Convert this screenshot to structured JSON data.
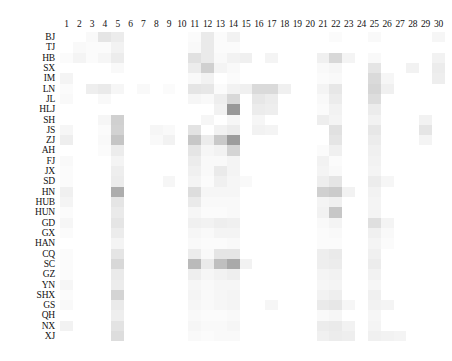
{
  "figure": {
    "type": "heatmap",
    "colormap": "greys",
    "background": "#ffffff",
    "low_color": "#ffffff",
    "high_color": "#4d4d4d"
  },
  "chart_data": {
    "type": "heatmap",
    "title": "",
    "xlabel": "",
    "ylabel": "",
    "grid": false,
    "legend": "none",
    "colormap": "Greys",
    "vmin": 0,
    "vmax": 1,
    "x": [
      "1",
      "2",
      "3",
      "4",
      "5",
      "6",
      "7",
      "8",
      "9",
      "10",
      "11",
      "12",
      "13",
      "14",
      "15",
      "16",
      "17",
      "18",
      "19",
      "20",
      "21",
      "22",
      "23",
      "24",
      "25",
      "26",
      "27",
      "28",
      "29",
      "30"
    ],
    "y": [
      "BJ",
      "TJ",
      "HB",
      "SX",
      "IM",
      "LN",
      "JL",
      "HLJ",
      "SH",
      "JS",
      "ZJ",
      "AH",
      "FJ",
      "JX",
      "SD",
      "HN",
      "HUB",
      "HUN",
      "GD",
      "GX",
      "HAN",
      "CQ",
      "SC",
      "GZ",
      "YN",
      "SHX",
      "GS",
      "QH",
      "NX",
      "XJ"
    ],
    "xlabel_position": "top",
    "values": [
      [
        0.0,
        0.0,
        0.03,
        0.12,
        0.09,
        0.0,
        0.0,
        0.0,
        0.0,
        0.0,
        0.02,
        0.1,
        0.02,
        0.06,
        0.0,
        0.0,
        0.0,
        0.0,
        0.0,
        0.0,
        0.0,
        0.02,
        0.0,
        0.0,
        0.03,
        0.0,
        0.0,
        0.0,
        0.0,
        0.04
      ],
      [
        0.0,
        0.03,
        0.02,
        0.02,
        0.06,
        0.0,
        0.0,
        0.0,
        0.0,
        0.0,
        0.03,
        0.1,
        0.02,
        0.02,
        0.0,
        0.0,
        0.0,
        0.0,
        0.0,
        0.0,
        0.0,
        0.0,
        0.0,
        0.0,
        0.0,
        0.0,
        0.0,
        0.0,
        0.0,
        0.0
      ],
      [
        0.02,
        0.05,
        0.02,
        0.04,
        0.09,
        0.0,
        0.0,
        0.0,
        0.0,
        0.0,
        0.14,
        0.1,
        0.03,
        0.06,
        0.07,
        0.0,
        0.05,
        0.0,
        0.0,
        0.0,
        0.07,
        0.18,
        0.05,
        0.0,
        0.03,
        0.0,
        0.0,
        0.0,
        0.0,
        0.06
      ],
      [
        0.0,
        0.0,
        0.0,
        0.0,
        0.03,
        0.0,
        0.0,
        0.0,
        0.0,
        0.0,
        0.09,
        0.22,
        0.05,
        0.03,
        0.0,
        0.0,
        0.0,
        0.0,
        0.0,
        0.0,
        0.03,
        0.04,
        0.0,
        0.0,
        0.12,
        0.0,
        0.0,
        0.06,
        0.0,
        0.09
      ],
      [
        0.05,
        0.0,
        0.0,
        0.0,
        0.0,
        0.0,
        0.0,
        0.0,
        0.0,
        0.0,
        0.03,
        0.06,
        0.0,
        0.02,
        0.0,
        0.0,
        0.0,
        0.0,
        0.0,
        0.0,
        0.02,
        0.03,
        0.0,
        0.0,
        0.17,
        0.04,
        0.0,
        0.0,
        0.0,
        0.08
      ],
      [
        0.02,
        0.0,
        0.08,
        0.1,
        0.04,
        0.0,
        0.03,
        0.0,
        0.02,
        0.0,
        0.12,
        0.11,
        0.02,
        0.06,
        0.07,
        0.17,
        0.17,
        0.07,
        0.0,
        0.0,
        0.05,
        0.11,
        0.0,
        0.0,
        0.19,
        0.07,
        0.0,
        0.0,
        0.0,
        0.0
      ],
      [
        0.03,
        0.0,
        0.0,
        0.03,
        0.0,
        0.0,
        0.0,
        0.0,
        0.0,
        0.0,
        0.04,
        0.03,
        0.08,
        0.18,
        0.0,
        0.11,
        0.09,
        0.0,
        0.0,
        0.0,
        0.03,
        0.09,
        0.0,
        0.0,
        0.16,
        0.0,
        0.0,
        0.0,
        0.0,
        0.0
      ],
      [
        0.0,
        0.0,
        0.0,
        0.0,
        0.0,
        0.0,
        0.0,
        0.0,
        0.0,
        0.0,
        0.0,
        0.0,
        0.06,
        0.48,
        0.0,
        0.09,
        0.08,
        0.0,
        0.0,
        0.0,
        0.02,
        0.06,
        0.0,
        0.0,
        0.09,
        0.0,
        0.0,
        0.0,
        0.0,
        0.0
      ],
      [
        0.0,
        0.0,
        0.0,
        0.04,
        0.22,
        0.0,
        0.0,
        0.0,
        0.0,
        0.0,
        0.0,
        0.04,
        0.0,
        0.04,
        0.0,
        0.04,
        0.0,
        0.0,
        0.0,
        0.0,
        0.08,
        0.05,
        0.0,
        0.0,
        0.06,
        0.0,
        0.0,
        0.0,
        0.06,
        0.0
      ],
      [
        0.04,
        0.0,
        0.0,
        0.02,
        0.21,
        0.0,
        0.0,
        0.04,
        0.03,
        0.0,
        0.13,
        0.0,
        0.06,
        0.09,
        0.0,
        0.06,
        0.05,
        0.0,
        0.0,
        0.0,
        0.0,
        0.14,
        0.0,
        0.0,
        0.11,
        0.0,
        0.0,
        0.0,
        0.12,
        0.0
      ],
      [
        0.08,
        0.0,
        0.0,
        0.03,
        0.27,
        0.0,
        0.0,
        0.03,
        0.06,
        0.0,
        0.26,
        0.09,
        0.25,
        0.46,
        0.0,
        0.0,
        0.0,
        0.0,
        0.0,
        0.0,
        0.0,
        0.12,
        0.0,
        0.0,
        0.09,
        0.0,
        0.0,
        0.0,
        0.05,
        0.0
      ],
      [
        0.0,
        0.0,
        0.0,
        0.02,
        0.09,
        0.0,
        0.0,
        0.0,
        0.0,
        0.0,
        0.12,
        0.04,
        0.06,
        0.2,
        0.0,
        0.0,
        0.0,
        0.0,
        0.0,
        0.0,
        0.02,
        0.07,
        0.0,
        0.0,
        0.07,
        0.0,
        0.0,
        0.0,
        0.0,
        0.0
      ],
      [
        0.03,
        0.0,
        0.0,
        0.0,
        0.05,
        0.0,
        0.0,
        0.0,
        0.0,
        0.0,
        0.09,
        0.03,
        0.03,
        0.05,
        0.0,
        0.0,
        0.0,
        0.0,
        0.0,
        0.0,
        0.06,
        0.02,
        0.0,
        0.0,
        0.06,
        0.0,
        0.0,
        0.0,
        0.0,
        0.0
      ],
      [
        0.02,
        0.0,
        0.0,
        0.0,
        0.08,
        0.0,
        0.0,
        0.0,
        0.0,
        0.0,
        0.07,
        0.03,
        0.1,
        0.05,
        0.0,
        0.0,
        0.0,
        0.0,
        0.0,
        0.0,
        0.05,
        0.03,
        0.0,
        0.0,
        0.05,
        0.0,
        0.0,
        0.0,
        0.0,
        0.0
      ],
      [
        0.02,
        0.0,
        0.0,
        0.0,
        0.09,
        0.0,
        0.0,
        0.0,
        0.04,
        0.0,
        0.05,
        0.02,
        0.07,
        0.04,
        0.03,
        0.0,
        0.0,
        0.0,
        0.0,
        0.0,
        0.08,
        0.12,
        0.0,
        0.0,
        0.09,
        0.04,
        0.0,
        0.0,
        0.0,
        0.0
      ],
      [
        0.07,
        0.0,
        0.0,
        0.0,
        0.38,
        0.0,
        0.0,
        0.0,
        0.0,
        0.0,
        0.16,
        0.04,
        0.04,
        0.04,
        0.0,
        0.0,
        0.0,
        0.0,
        0.0,
        0.0,
        0.22,
        0.24,
        0.06,
        0.0,
        0.06,
        0.0,
        0.0,
        0.0,
        0.0,
        0.0
      ],
      [
        0.05,
        0.0,
        0.0,
        0.0,
        0.12,
        0.0,
        0.0,
        0.0,
        0.0,
        0.0,
        0.1,
        0.03,
        0.03,
        0.03,
        0.0,
        0.0,
        0.0,
        0.0,
        0.0,
        0.0,
        0.05,
        0.07,
        0.0,
        0.0,
        0.05,
        0.0,
        0.0,
        0.0,
        0.0,
        0.0
      ],
      [
        0.02,
        0.0,
        0.0,
        0.0,
        0.1,
        0.0,
        0.0,
        0.0,
        0.0,
        0.0,
        0.04,
        0.02,
        0.02,
        0.03,
        0.0,
        0.0,
        0.0,
        0.0,
        0.0,
        0.0,
        0.06,
        0.26,
        0.0,
        0.0,
        0.05,
        0.0,
        0.0,
        0.0,
        0.0,
        0.0
      ],
      [
        0.04,
        0.0,
        0.0,
        0.0,
        0.12,
        0.0,
        0.0,
        0.0,
        0.0,
        0.0,
        0.07,
        0.06,
        0.08,
        0.07,
        0.0,
        0.0,
        0.0,
        0.0,
        0.0,
        0.0,
        0.03,
        0.05,
        0.0,
        0.0,
        0.15,
        0.05,
        0.0,
        0.0,
        0.0,
        0.0
      ],
      [
        0.02,
        0.0,
        0.0,
        0.0,
        0.09,
        0.0,
        0.0,
        0.0,
        0.0,
        0.0,
        0.04,
        0.03,
        0.05,
        0.05,
        0.0,
        0.0,
        0.0,
        0.0,
        0.0,
        0.0,
        0.02,
        0.03,
        0.0,
        0.0,
        0.07,
        0.03,
        0.0,
        0.0,
        0.0,
        0.0
      ],
      [
        0.0,
        0.0,
        0.0,
        0.0,
        0.05,
        0.0,
        0.0,
        0.0,
        0.0,
        0.0,
        0.03,
        0.02,
        0.02,
        0.03,
        0.0,
        0.0,
        0.0,
        0.0,
        0.0,
        0.0,
        0.02,
        0.02,
        0.0,
        0.0,
        0.05,
        0.02,
        0.0,
        0.0,
        0.0,
        0.0
      ],
      [
        0.02,
        0.0,
        0.0,
        0.0,
        0.12,
        0.0,
        0.0,
        0.0,
        0.0,
        0.0,
        0.09,
        0.03,
        0.12,
        0.12,
        0.0,
        0.0,
        0.0,
        0.0,
        0.0,
        0.0,
        0.08,
        0.1,
        0.0,
        0.0,
        0.07,
        0.0,
        0.0,
        0.0,
        0.0,
        0.0
      ],
      [
        0.02,
        0.0,
        0.0,
        0.0,
        0.18,
        0.0,
        0.0,
        0.0,
        0.0,
        0.0,
        0.32,
        0.1,
        0.3,
        0.4,
        0.06,
        0.0,
        0.0,
        0.0,
        0.0,
        0.0,
        0.08,
        0.09,
        0.0,
        0.0,
        0.09,
        0.0,
        0.0,
        0.0,
        0.0,
        0.0
      ],
      [
        0.02,
        0.0,
        0.0,
        0.0,
        0.1,
        0.0,
        0.0,
        0.0,
        0.0,
        0.0,
        0.08,
        0.04,
        0.06,
        0.08,
        0.0,
        0.0,
        0.0,
        0.0,
        0.0,
        0.0,
        0.05,
        0.06,
        0.0,
        0.0,
        0.06,
        0.0,
        0.0,
        0.0,
        0.0,
        0.0
      ],
      [
        0.04,
        0.0,
        0.0,
        0.0,
        0.09,
        0.0,
        0.0,
        0.0,
        0.0,
        0.0,
        0.04,
        0.03,
        0.04,
        0.04,
        0.0,
        0.0,
        0.0,
        0.0,
        0.0,
        0.0,
        0.04,
        0.05,
        0.0,
        0.0,
        0.04,
        0.0,
        0.0,
        0.0,
        0.0,
        0.0
      ],
      [
        0.02,
        0.0,
        0.0,
        0.0,
        0.2,
        0.0,
        0.0,
        0.0,
        0.0,
        0.0,
        0.05,
        0.03,
        0.04,
        0.05,
        0.0,
        0.0,
        0.0,
        0.0,
        0.0,
        0.0,
        0.06,
        0.08,
        0.0,
        0.0,
        0.07,
        0.0,
        0.0,
        0.0,
        0.0,
        0.0
      ],
      [
        0.03,
        0.0,
        0.0,
        0.0,
        0.1,
        0.0,
        0.0,
        0.0,
        0.0,
        0.0,
        0.04,
        0.03,
        0.04,
        0.05,
        0.0,
        0.0,
        0.04,
        0.0,
        0.0,
        0.0,
        0.1,
        0.11,
        0.04,
        0.0,
        0.06,
        0.05,
        0.0,
        0.0,
        0.0,
        0.0
      ],
      [
        0.0,
        0.0,
        0.0,
        0.0,
        0.08,
        0.0,
        0.0,
        0.0,
        0.0,
        0.0,
        0.03,
        0.02,
        0.02,
        0.03,
        0.0,
        0.0,
        0.0,
        0.0,
        0.0,
        0.0,
        0.03,
        0.04,
        0.0,
        0.0,
        0.04,
        0.0,
        0.0,
        0.0,
        0.0,
        0.0
      ],
      [
        0.06,
        0.0,
        0.0,
        0.0,
        0.13,
        0.0,
        0.0,
        0.0,
        0.0,
        0.0,
        0.04,
        0.03,
        0.03,
        0.04,
        0.0,
        0.0,
        0.0,
        0.0,
        0.0,
        0.0,
        0.09,
        0.1,
        0.06,
        0.0,
        0.05,
        0.0,
        0.0,
        0.0,
        0.0,
        0.0
      ],
      [
        0.0,
        0.0,
        0.0,
        0.0,
        0.16,
        0.0,
        0.0,
        0.0,
        0.0,
        0.0,
        0.03,
        0.02,
        0.03,
        0.03,
        0.0,
        0.0,
        0.0,
        0.0,
        0.0,
        0.0,
        0.07,
        0.09,
        0.08,
        0.0,
        0.07,
        0.06,
        0.05,
        0.0,
        0.0,
        0.0
      ]
    ]
  }
}
